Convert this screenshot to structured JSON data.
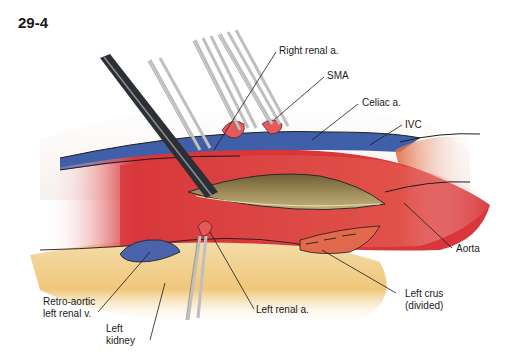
{
  "figure": {
    "number": "29-4"
  },
  "labels": {
    "right_renal_a": "Right renal a.",
    "sma": "SMA",
    "celiac_a": "Celiac a.",
    "ivc": "IVC",
    "aorta": "Aorta",
    "left_crus_1": "Left crus",
    "left_crus_2": "(divided)",
    "left_renal_a": "Left renal a.",
    "retro_aortic_1": "Retro-aortic",
    "retro_aortic_2": "left renal v.",
    "left_kidney_1": "Left",
    "left_kidney_2": "kidney"
  },
  "colors": {
    "aorta_red": "#d8363a",
    "ivc_blue": "#3f5fa8",
    "kidney_yellow": "#f1d79a",
    "lumen_tan": "#8a7a4a",
    "instrument_dark": "#2c2f33"
  }
}
